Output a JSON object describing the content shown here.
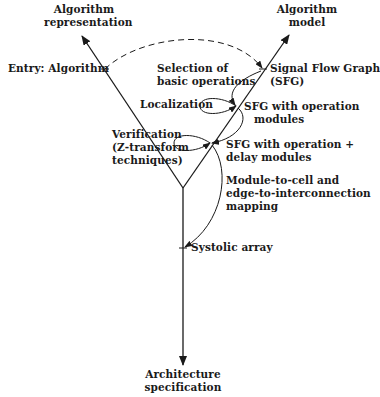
{
  "diagram": {
    "top_left": {
      "line1": "Algorithm",
      "line2": "representation"
    },
    "top_right": {
      "line1": "Algorithm",
      "line2": "model"
    },
    "bottom": {
      "line1": "Architecture",
      "line2": "specification"
    },
    "entry": "Entry: Algorithm",
    "selection": {
      "line1": "Selection of",
      "line2": "basic operations"
    },
    "sfg": {
      "line1": "Signal Flow Graph",
      "line2": "(SFG)"
    },
    "localization": "Localization",
    "sfg_op": {
      "line1": "SFG with operation",
      "line2": "modules"
    },
    "verification": {
      "line1": "Verification",
      "line2": "(Z-transform",
      "line3": "techniques)"
    },
    "sfg_delay": {
      "line1": "SFG with operation +",
      "line2": "delay modules"
    },
    "mapping": {
      "line1": "Module-to-cell and",
      "line2": "edge-to-interconnection",
      "line3": "mapping"
    },
    "systolic": "Systolic array"
  },
  "colors": {
    "ink": "#1a1a1a",
    "background": "#ffffff"
  }
}
